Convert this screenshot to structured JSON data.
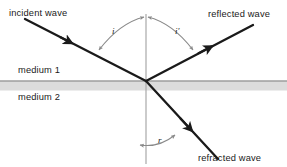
{
  "diagram": {
    "width": 287,
    "height": 167,
    "background_color": "#ffffff",
    "labels": {
      "incident_wave": "incident wave",
      "reflected_wave": "reflected wave",
      "refracted_wave": "refracted wave",
      "medium_1": "medium 1",
      "medium_2": "medium 2"
    },
    "angles": {
      "incidence": "i",
      "reflection": "i′",
      "refraction": "r"
    },
    "colors": {
      "ray_stroke": "#1a1a1a",
      "normal_line": "#a8a8a8",
      "interface_line": "#777777",
      "interface_band": "#dcdcdc",
      "arc_stroke": "#8a8a8a",
      "text": "#1a1a1a"
    },
    "geometry": {
      "intersection_x": 146,
      "intersection_y": 81,
      "interface_y": 81,
      "normal_top_y": 14,
      "normal_bottom_y": 163,
      "incident_start": [
        25,
        19
      ],
      "reflected_end": [
        253,
        25
      ],
      "refracted_end": [
        218,
        159
      ]
    }
  }
}
